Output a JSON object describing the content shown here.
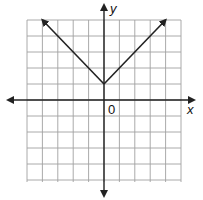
{
  "chart_data": {
    "type": "line",
    "title": "",
    "xlabel": "x",
    "ylabel": "y",
    "origin_label": "0",
    "function": "y = |x| + 1",
    "xlim": [
      -5,
      5
    ],
    "ylim": [
      -5,
      5
    ],
    "grid": true,
    "series": [
      {
        "name": "absolute value graph",
        "x": [
          -4,
          0,
          4
        ],
        "y": [
          5,
          1,
          5
        ],
        "arrows_at_ends": true
      }
    ],
    "vertex": [
      0,
      1
    ]
  },
  "colors": {
    "grid": "#a0a0a0",
    "axis": "#222222",
    "line": "#222222"
  }
}
